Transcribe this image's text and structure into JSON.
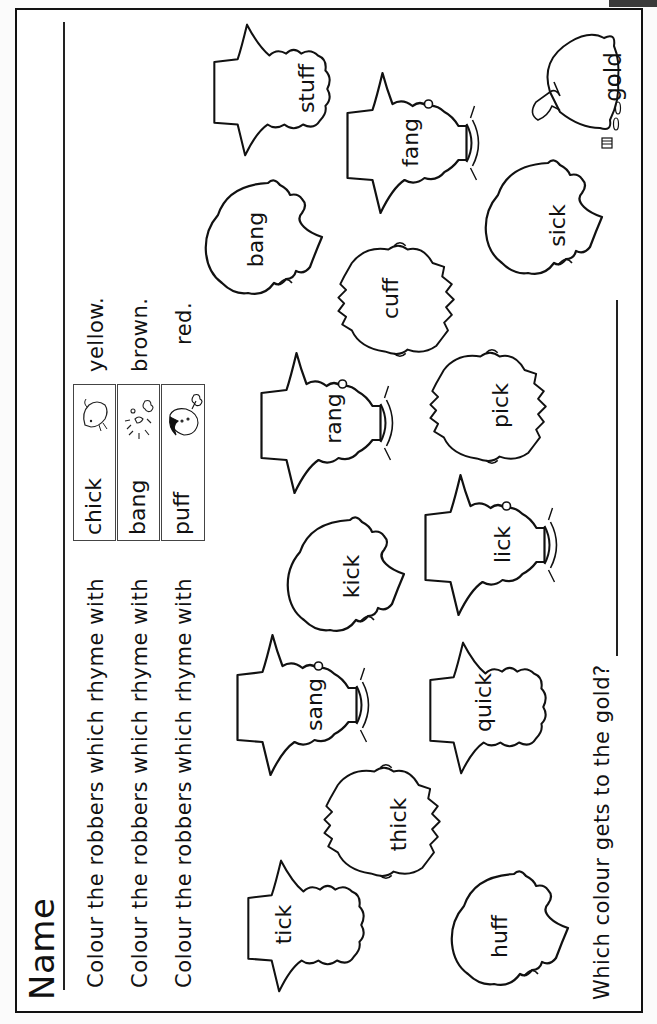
{
  "worksheet": {
    "name_label": "Name",
    "instructions": [
      {
        "prefix": "Colour the robbers which rhyme with",
        "word": "chick",
        "picture": "chick-icon",
        "colour": "yellow."
      },
      {
        "prefix": "Colour the robbers which rhyme with",
        "word": "bang",
        "picture": "explosion-icon",
        "colour": "brown."
      },
      {
        "prefix": "Colour the robbers which rhyme with",
        "word": "puff",
        "picture": "puffing-boy-icon",
        "colour": "red."
      }
    ],
    "question": "Which colour gets to the gold?",
    "gold_bag": {
      "label": "gold",
      "icon": "money-bag-icon"
    },
    "robbers": [
      {
        "word": "stuff",
        "style": "hat"
      },
      {
        "word": "fang",
        "style": "hat-collar"
      },
      {
        "word": "bang",
        "style": "profile"
      },
      {
        "word": "sick",
        "style": "profile"
      },
      {
        "word": "cuff",
        "style": "fuzzy"
      },
      {
        "word": "rang",
        "style": "hat-collar"
      },
      {
        "word": "pick",
        "style": "fuzzy"
      },
      {
        "word": "kick",
        "style": "profile"
      },
      {
        "word": "lick",
        "style": "hat-collar"
      },
      {
        "word": "sang",
        "style": "hat-collar"
      },
      {
        "word": "quick",
        "style": "hat"
      },
      {
        "word": "thick",
        "style": "fuzzy"
      },
      {
        "word": "tick",
        "style": "hat"
      },
      {
        "word": "huff",
        "style": "profile"
      }
    ]
  }
}
